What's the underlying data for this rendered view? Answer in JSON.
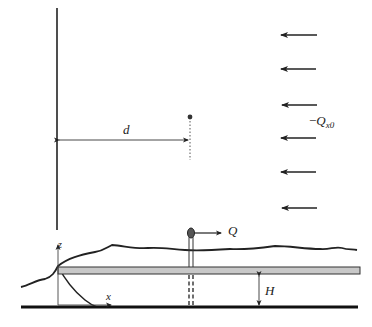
{
  "diagram": {
    "type": "aquifer well with uniform flow near a stream boundary",
    "labels": {
      "distance": "d",
      "uniform_flow_sign": "−",
      "uniform_flow_symbol": "Q",
      "uniform_flow_subscript": "x0",
      "pumping_rate": "Q",
      "aquifer_thickness": "H",
      "z_axis": "z",
      "x_axis": "x"
    },
    "uniform_flow_arrows_count": 6,
    "colors": {
      "line": "#222222",
      "aquifer_layer_fill": "#c8c8c8",
      "well_head_fill": "#555555",
      "background": "#ffffff"
    }
  }
}
